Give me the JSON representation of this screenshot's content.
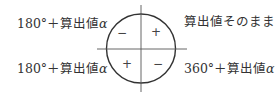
{
  "diagram": {
    "labels": {
      "top_left": {
        "prefix": "180°＋算出値",
        "symbol": "α"
      },
      "bottom_left": {
        "prefix": "180°＋算出値",
        "symbol": "α"
      },
      "top_right": {
        "text": "算出値そのまま"
      },
      "bottom_right": {
        "prefix": "360°＋算出値",
        "symbol": "α"
      }
    },
    "quadrant_signs": {
      "q2_upper_left": "−",
      "q1_upper_right": "+",
      "q3_lower_left": "+",
      "q4_lower_right": "−"
    },
    "colors": {
      "stroke": "#333333",
      "text": "#333333"
    }
  }
}
